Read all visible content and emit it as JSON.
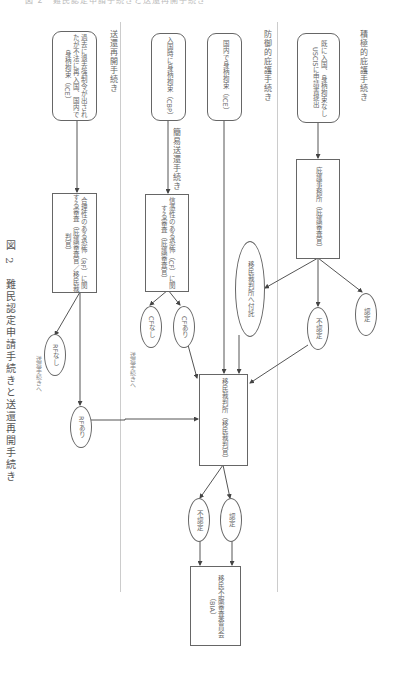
{
  "figure": {
    "caption_number": "図 2",
    "caption_title": "難民認定申請手続きと送還再開手続き",
    "top_cut_text": "図 2　難民認定申請手続きと送還再開手続き"
  },
  "lanes": [
    {
      "id": "affirmative",
      "label": "積極的庇護手続き"
    },
    {
      "id": "defensive",
      "label": "防御的庇護手続き"
    },
    {
      "id": "reinstatement",
      "label": "送還再開手続き"
    }
  ],
  "nodes": {
    "affirmative_start": "既に入国、身柄拘束なし USCISに申請書提出",
    "asylum_office": "庇護事務所（庇護審査官）",
    "granted_ao": "認定",
    "denied_ao": "不認定",
    "referred_ic": "移民裁判所へ付託",
    "defensive_ice": "国内で身柄拘束（ICE）",
    "defensive_cbp": "入国時に身柄拘束（CBP）",
    "expedited_label": "簡易送還手続き",
    "cf_review": "信憑性のある恐怖（CF）に関する審査（庇護審査官）",
    "cf_yes": "CFあり",
    "cf_no": "CFなし",
    "cf_no_note": "送還手続きへ",
    "reinstatement_start": "過去に退去強制令が出されたが不法に再入国、国内で身柄拘束（ICE）",
    "rf_review": "合理性のある恐怖（RF）に関する審査（庇護審査官／移民裁判官）",
    "rf_yes": "RFあり",
    "rf_no": "RFなし",
    "rf_no_note": "送還手続きへ",
    "immigration_court": "移民裁判所（移民裁判官）",
    "granted_ic": "認定",
    "denied_ic": "不認定",
    "bia": "移民不服審査委員会（BIA）"
  },
  "colors": {
    "line": "#555555",
    "border": "#666666",
    "separator": "#cccccc",
    "text": "#666666"
  }
}
